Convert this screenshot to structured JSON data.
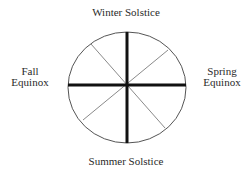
{
  "diagram": {
    "labels": {
      "top": "Winter Solstice",
      "bottom": "Summer Solstice",
      "left": [
        "Fall",
        "Equinox"
      ],
      "right": [
        "Spring",
        "Equinox"
      ]
    },
    "colors": {
      "stroke": "#111111",
      "thin_stroke": "#8a8a8a",
      "outline": "#555555",
      "background": "#ffffff"
    }
  }
}
